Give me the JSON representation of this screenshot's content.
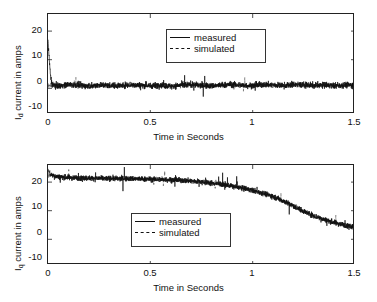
{
  "figure": {
    "title": "",
    "width": 377,
    "height": 302
  },
  "legend": {
    "measured_label": "measured",
    "simulated_label": "simulated"
  },
  "panels": [
    {
      "id": "id-current-panel",
      "ylabel_main": "current in amps",
      "ylabel_symbol": "I",
      "ylabel_subscript": "d",
      "xlabel": "Time in Seconds",
      "yticks": [
        "20",
        "10",
        "0",
        "-10"
      ],
      "xticks": [
        "0",
        "0.5",
        "1",
        "1.5"
      ]
    },
    {
      "id": "iq-current-panel",
      "ylabel_main": "current in amps",
      "ylabel_symbol": "I",
      "ylabel_subscript": "q",
      "xlabel": "Time in Seconds",
      "yticks": [
        "20",
        "10",
        "0",
        "-10"
      ],
      "xticks": [
        "0",
        "0.5",
        "1",
        "1.5"
      ]
    }
  ],
  "chart_data": [
    {
      "type": "line",
      "id": "id-current",
      "title": "",
      "xlabel": "Time in Seconds",
      "ylabel": "Id current in amps",
      "xlim": [
        0,
        1.5
      ],
      "ylim": [
        -10,
        25
      ],
      "xticks": [
        0,
        0.5,
        1,
        1.5
      ],
      "yticks": [
        -10,
        0,
        10,
        20
      ],
      "grid": false,
      "legend_position": "upper-center",
      "series": [
        {
          "name": "measured",
          "style": "solid",
          "color": "#111111",
          "description": "Noisy direct-axis current oscillating about 0 A with a brief positive transient of about 8 A at t = 0; noise band roughly -3 to +3 A for the whole record.",
          "x": [
            0.0,
            0.02,
            0.05,
            0.1,
            0.15,
            0.2,
            0.25,
            0.3,
            0.35,
            0.4,
            0.45,
            0.5,
            0.55,
            0.6,
            0.65,
            0.7,
            0.75,
            0.8,
            0.85,
            0.9,
            0.95,
            1.0,
            1.05,
            1.1,
            1.15,
            1.2,
            1.25,
            1.3,
            1.35,
            1.4,
            1.45,
            1.5
          ],
          "values": [
            8.0,
            0.3,
            -0.2,
            0.4,
            0.1,
            -0.3,
            0.2,
            0.0,
            -0.1,
            0.3,
            0.1,
            -0.2,
            0.2,
            -0.4,
            0.1,
            0.3,
            0.0,
            -0.2,
            0.1,
            0.4,
            0.0,
            -0.1,
            0.3,
            0.2,
            -0.1,
            0.4,
            0.2,
            0.0,
            0.1,
            -0.1,
            0.2,
            0.1
          ]
        },
        {
          "name": "simulated",
          "style": "dashed",
          "color": "#555555",
          "description": "Simulated direct-axis current, essentially flat at 0 A and overlaid by the measured trace.",
          "x": [
            0.0,
            0.25,
            0.5,
            0.75,
            1.0,
            1.25,
            1.5
          ],
          "values": [
            0.0,
            0.0,
            0.0,
            0.0,
            0.0,
            0.0,
            0.0
          ]
        }
      ]
    },
    {
      "type": "line",
      "id": "iq-current",
      "title": "",
      "xlabel": "Time in Seconds",
      "ylabel": "Iq current in amps",
      "xlim": [
        0,
        1.5
      ],
      "ylim": [
        -10,
        25
      ],
      "xticks": [
        0,
        0.5,
        1,
        1.5
      ],
      "yticks": [
        -10,
        0,
        10,
        20
      ],
      "grid": false,
      "legend_position": "center-left",
      "series": [
        {
          "name": "measured",
          "style": "solid",
          "color": "#111111",
          "description": "Noisy quadrature-axis current starting near 22 A, holding about 20 A until t = 0.8 s, then decaying to roughly 3 A by t = 1.5 s.",
          "x": [
            0.0,
            0.05,
            0.1,
            0.15,
            0.2,
            0.25,
            0.3,
            0.35,
            0.4,
            0.45,
            0.5,
            0.55,
            0.6,
            0.65,
            0.7,
            0.75,
            0.8,
            0.85,
            0.9,
            0.95,
            1.0,
            1.05,
            1.1,
            1.15,
            1.2,
            1.25,
            1.3,
            1.35,
            1.4,
            1.45,
            1.5
          ],
          "values": [
            22.0,
            20.8,
            20.6,
            20.5,
            20.4,
            20.3,
            20.3,
            20.2,
            20.2,
            20.1,
            20.0,
            19.9,
            19.8,
            19.6,
            19.4,
            19.1,
            18.7,
            18.2,
            17.6,
            16.9,
            16.1,
            15.2,
            14.0,
            12.4,
            10.6,
            8.8,
            7.2,
            5.9,
            4.8,
            4.0,
            3.3
          ]
        },
        {
          "name": "simulated",
          "style": "dashed",
          "color": "#555555",
          "description": "Simulated quadrature-axis current tracking the measured mean trend closely across the whole record.",
          "x": [
            0.0,
            0.1,
            0.2,
            0.3,
            0.4,
            0.5,
            0.6,
            0.7,
            0.8,
            0.9,
            1.0,
            1.1,
            1.2,
            1.3,
            1.4,
            1.5
          ],
          "values": [
            21.5,
            20.7,
            20.5,
            20.4,
            20.3,
            20.1,
            19.9,
            19.4,
            18.7,
            17.6,
            16.1,
            14.0,
            10.6,
            7.2,
            4.8,
            3.2
          ]
        }
      ]
    }
  ]
}
